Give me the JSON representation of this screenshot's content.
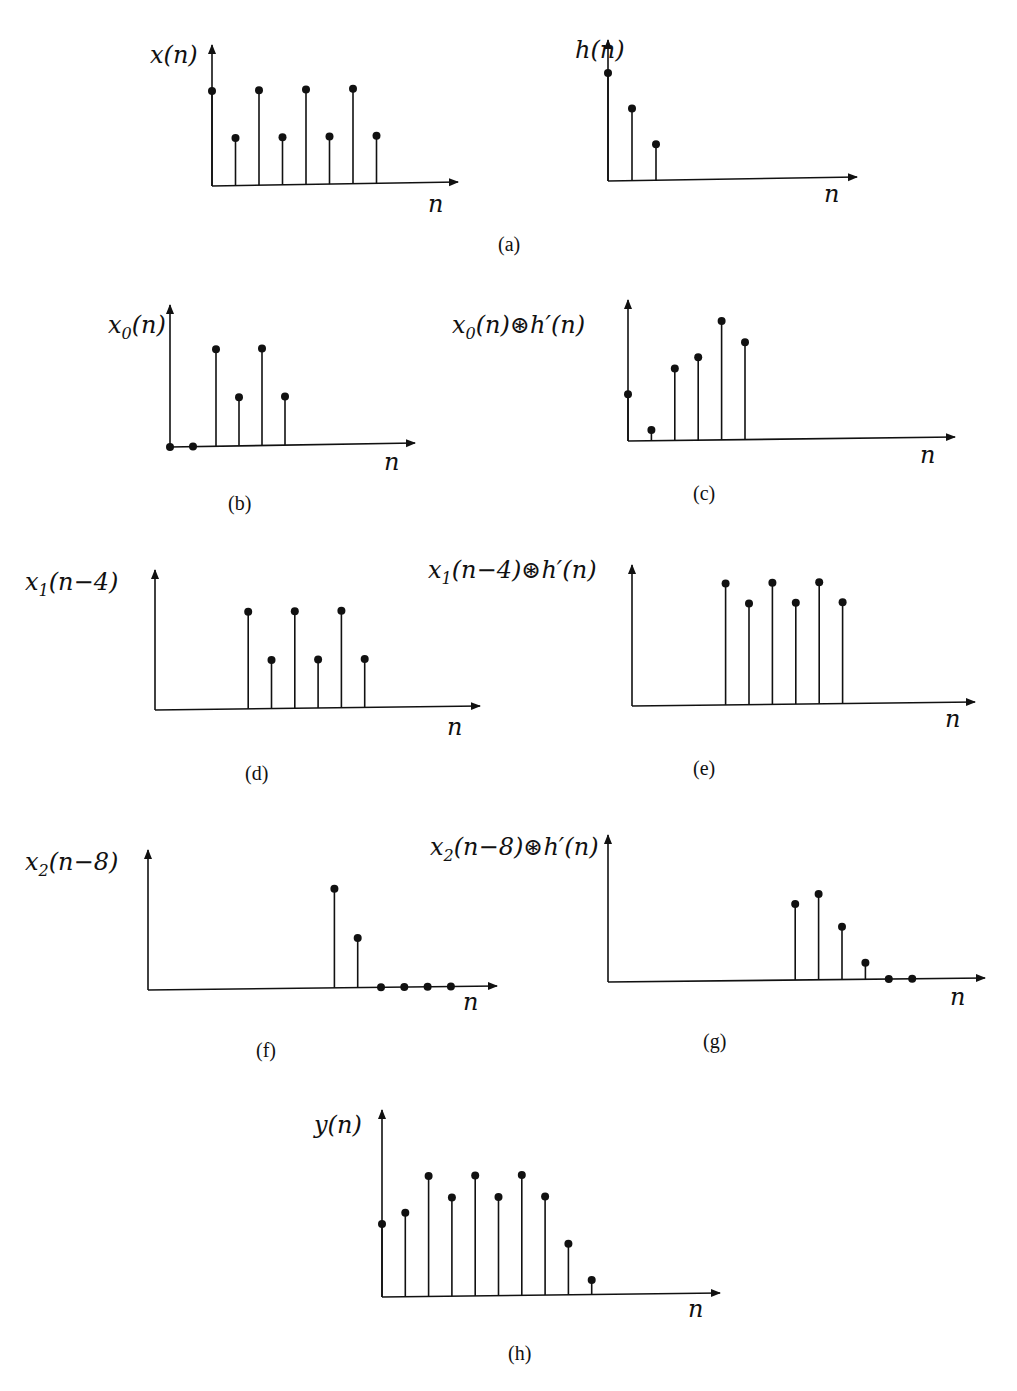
{
  "figure": {
    "bottom_fragment": "...ção ... ntr...",
    "panels": [
      {
        "id": "a1",
        "caption": "",
        "ylabel": "x(n)",
        "xlabel": "n"
      },
      {
        "id": "a2",
        "caption": "",
        "ylabel": "h(n)",
        "xlabel": "n"
      },
      {
        "id": "b",
        "caption": "(b)",
        "ylabel": "x0(n)",
        "xlabel": "n"
      },
      {
        "id": "c",
        "caption": "(c)",
        "ylabel": "x0(n)⊛h′(n)",
        "xlabel": "n"
      },
      {
        "id": "d",
        "caption": "(d)",
        "ylabel": "x1(n−4)",
        "xlabel": "n"
      },
      {
        "id": "e",
        "caption": "(e)",
        "ylabel": "x1(n−4)⊛h′(n)",
        "xlabel": "n"
      },
      {
        "id": "f",
        "caption": "(f)",
        "ylabel": "x2(n−8)",
        "xlabel": "n"
      },
      {
        "id": "g",
        "caption": "(g)",
        "ylabel": "x2(n−8)⊛h′(n)",
        "xlabel": "n"
      },
      {
        "id": "h",
        "caption": "(h)",
        "ylabel": "y(n)",
        "xlabel": "n"
      }
    ],
    "caption_a": "(a)"
  },
  "chart_data": [
    {
      "type": "stem",
      "title": "(a) input",
      "ylabel": "x(n)",
      "xlabel": "n",
      "x": [
        0,
        1,
        2,
        3,
        4,
        5,
        6,
        7
      ],
      "values": [
        2,
        1,
        2,
        1,
        2,
        1,
        2,
        1
      ]
    },
    {
      "type": "stem",
      "title": "(a) impulse response",
      "ylabel": "h(n)",
      "xlabel": "n",
      "x": [
        0,
        1,
        2
      ],
      "values": [
        3,
        2,
        1
      ]
    },
    {
      "type": "stem",
      "title": "(b)",
      "ylabel": "x0(n)",
      "xlabel": "n",
      "x": [
        0,
        1,
        2,
        3,
        4,
        5
      ],
      "values": [
        0,
        0,
        2,
        1,
        2,
        1
      ]
    },
    {
      "type": "stem",
      "title": "(c)",
      "ylabel": "x0(n)⊛h′(n)",
      "xlabel": "n",
      "x": [
        0,
        1,
        2,
        3,
        4,
        5
      ],
      "values": [
        1.3,
        0.3,
        2.0,
        2.3,
        3.3,
        2.7
      ]
    },
    {
      "type": "stem",
      "title": "(d)",
      "ylabel": "x1(n−4)",
      "xlabel": "n",
      "x": [
        4,
        5,
        6,
        7,
        8,
        9
      ],
      "values": [
        2,
        1,
        2,
        1,
        2,
        1
      ]
    },
    {
      "type": "stem",
      "title": "(e)",
      "ylabel": "x1(n−4)⊛h′(n)",
      "xlabel": "n",
      "x": [
        4,
        5,
        6,
        7,
        8,
        9
      ],
      "values": [
        3,
        2.5,
        3,
        2.5,
        3,
        2.5
      ]
    },
    {
      "type": "stem",
      "title": "(f)",
      "ylabel": "x2(n−8)",
      "xlabel": "n",
      "x": [
        8,
        9,
        10,
        11,
        12,
        13
      ],
      "values": [
        2,
        1,
        0,
        0,
        0,
        0
      ]
    },
    {
      "type": "stem",
      "title": "(g)",
      "ylabel": "x2(n−8)⊛h′(n)",
      "xlabel": "n",
      "x": [
        8,
        9,
        10,
        11,
        12,
        13
      ],
      "values": [
        2.3,
        2.6,
        1.6,
        0.5,
        0,
        0
      ]
    },
    {
      "type": "stem",
      "title": "(h)",
      "ylabel": "y(n)",
      "xlabel": "n",
      "x": [
        0,
        1,
        2,
        3,
        4,
        5,
        6,
        7,
        8,
        9
      ],
      "values": [
        2,
        2.3,
        3.3,
        2.7,
        3.3,
        2.7,
        3.3,
        2.7,
        1.4,
        0.4
      ]
    }
  ]
}
